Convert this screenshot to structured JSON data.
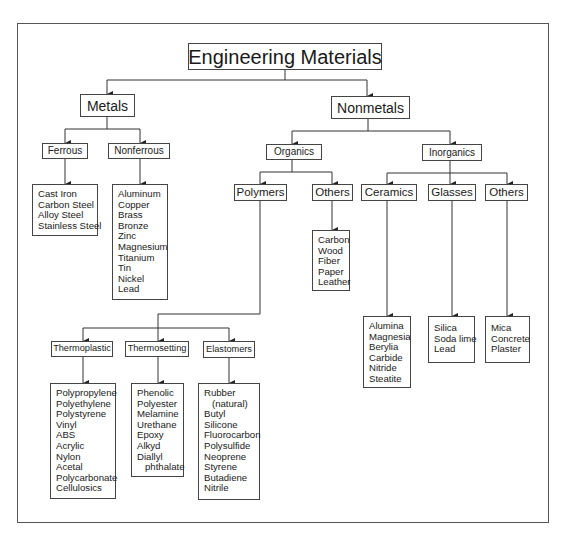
{
  "diagram": {
    "title": "Engineering Materials",
    "metals": {
      "label": "Metals",
      "ferrous": {
        "label": "Ferrous",
        "items": [
          "Cast Iron",
          "Carbon Steel",
          "Alloy Steel",
          "Stainless Steel"
        ]
      },
      "nonferrous": {
        "label": "Nonferrous",
        "items": [
          "Aluminum",
          "Copper",
          "Brass",
          "Bronze",
          "Zinc",
          "Magnesium",
          "Titanium",
          "Tin",
          "Nickel",
          "Lead"
        ]
      }
    },
    "nonmetals": {
      "label": "Nonmetals",
      "organics": {
        "label": "Organics",
        "polymers": {
          "label": "Polymers",
          "thermoplastic": {
            "label": "Thermoplastic",
            "items": [
              "Polypropylene",
              "Polyethylene",
              "Polystyrene",
              "Vinyl",
              "ABS",
              "Acrylic",
              "Nylon",
              "Acetal",
              "Polycarbonate",
              "Cellulosics"
            ]
          },
          "thermosetting": {
            "label": "Thermosetting",
            "items": [
              "Phenolic",
              "Polyester",
              "Melamine",
              "Urethane",
              "Epoxy",
              "Alkyd",
              "Diallyl",
              "phthalate"
            ]
          },
          "elastomers": {
            "label": "Elastomers",
            "items": [
              "Rubber",
              "(natural)",
              "Butyl",
              "Silicone",
              "Fluorocarbon",
              "Polysulfide",
              "Neoprene",
              "Styrene",
              "Butadiene",
              "Nitrile"
            ]
          }
        },
        "others": {
          "label": "Others",
          "items": [
            "Carbon",
            "Wood",
            "Fiber",
            "Paper",
            "Leather"
          ]
        }
      },
      "inorganics": {
        "label": "Inorganics",
        "ceramics": {
          "label": "Ceramics",
          "items": [
            "Alumina",
            "Magnesia",
            "Berylia",
            "Carbide",
            "Nitride",
            "Steatite"
          ]
        },
        "glasses": {
          "label": "Glasses",
          "items": [
            "Silica",
            "Soda lime",
            "Lead"
          ]
        },
        "others": {
          "label": "Others",
          "items": [
            "Mica",
            "Concrete",
            "Plaster"
          ]
        }
      }
    }
  }
}
